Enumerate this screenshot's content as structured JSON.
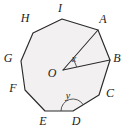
{
  "figure": {
    "shape_name": "regular-nonagon",
    "sides": 9,
    "fill_color": "#f2f0f0",
    "stroke_color": "#2a2a2a",
    "background_color": "#ffffff",
    "label_color": "#1c1c1c",
    "vertices": [
      {
        "label": "A",
        "x": 98,
        "y": 30,
        "label_x": 103,
        "label_y": 23
      },
      {
        "label": "B",
        "x": 110,
        "y": 60,
        "label_x": 117,
        "label_y": 62
      },
      {
        "label": "C",
        "x": 99,
        "y": 95,
        "label_x": 110,
        "label_y": 97
      },
      {
        "label": "D",
        "x": 73,
        "y": 111,
        "label_x": 76,
        "label_y": 125
      },
      {
        "label": "E",
        "x": 45,
        "y": 111,
        "label_x": 43,
        "label_y": 125
      },
      {
        "label": "F",
        "x": 25,
        "y": 90,
        "label_x": 13,
        "label_y": 92
      },
      {
        "label": "G",
        "x": 21,
        "y": 61,
        "label_x": 8,
        "label_y": 62
      },
      {
        "label": "H",
        "x": 33,
        "y": 33,
        "label_x": 25,
        "label_y": 22
      },
      {
        "label": "I",
        "x": 62,
        "y": 19,
        "label_x": 60,
        "label_y": 12
      }
    ],
    "center": {
      "label": "O",
      "x": 63,
      "y": 70,
      "label_x": 52,
      "label_y": 77
    },
    "radii": [
      {
        "name": "OA",
        "from": "O",
        "to": "A"
      },
      {
        "name": "OB",
        "from": "O",
        "to": "B"
      }
    ],
    "angles": [
      {
        "label": "x",
        "at_vertex": "O",
        "between": [
          "OA",
          "OB"
        ],
        "label_x": 74,
        "label_y": 62,
        "arc_radius": 14
      },
      {
        "label": "y",
        "at_vertex": "D",
        "between": [
          "DE",
          "DC"
        ],
        "label_x": 68,
        "label_y": 99,
        "arc_radius": 12
      }
    ],
    "edges": [
      "AB",
      "BC",
      "CD",
      "DE",
      "EF",
      "FG",
      "GH",
      "HI",
      "IA"
    ]
  }
}
